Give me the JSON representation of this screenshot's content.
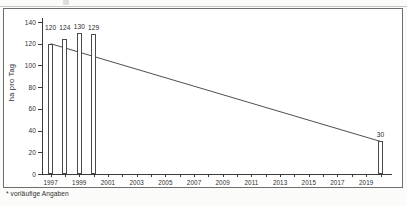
{
  "figure": {
    "footnote": "* vorläufige Angaben",
    "frame_color": "#6e6e6c",
    "ink_color": "#3a3a38",
    "bar_fill": "#ffffff",
    "bar_stroke": "#4a4a48"
  },
  "chart_data": {
    "type": "bar",
    "title": "",
    "xlabel": "",
    "ylabel": "ha pro Tag",
    "ylim": [
      0,
      140
    ],
    "ytick_values": [
      0,
      20,
      40,
      60,
      80,
      100,
      120,
      140
    ],
    "ytick_labels": [
      "0",
      "20",
      "40",
      "60",
      "80",
      "100",
      "120",
      "140"
    ],
    "grid": false,
    "legend": "none",
    "xlim": [
      1996.4,
      2020.8
    ],
    "xtick_values": [
      1997,
      1998,
      1999,
      2000,
      2001,
      2002,
      2003,
      2004,
      2005,
      2006,
      2007,
      2008,
      2009,
      2010,
      2011,
      2012,
      2013,
      2014,
      2015,
      2016,
      2017,
      2018,
      2019,
      2020
    ],
    "xtick_labels": [
      {
        "x": 1997,
        "label": "1997"
      },
      {
        "x": 1999,
        "label": "1999"
      },
      {
        "x": 2001,
        "label": "2001"
      },
      {
        "x": 2003,
        "label": "2003"
      },
      {
        "x": 2005,
        "label": "2005"
      },
      {
        "x": 2007,
        "label": "2007"
      },
      {
        "x": 2009,
        "label": "2009"
      },
      {
        "x": 2011,
        "label": "2011"
      },
      {
        "x": 2013,
        "label": "2013"
      },
      {
        "x": 2015,
        "label": "2015"
      },
      {
        "x": 2017,
        "label": "2017"
      },
      {
        "x": 2019,
        "label": "2019"
      }
    ],
    "categories": [
      1997,
      1998,
      1999,
      2000,
      2020
    ],
    "values": [
      120,
      124,
      130,
      129,
      30
    ],
    "bar_labels": [
      "120",
      "124",
      "130",
      "129",
      "30"
    ],
    "series": [
      {
        "name": "ha pro Tag",
        "type": "bar",
        "points": [
          {
            "x": 1997,
            "y": 120,
            "label": "120"
          },
          {
            "x": 1998,
            "y": 124,
            "label": "124"
          },
          {
            "x": 1999,
            "y": 130,
            "label": "130"
          },
          {
            "x": 2000,
            "y": 129,
            "label": "129"
          },
          {
            "x": 2020,
            "y": 30,
            "label": "30"
          }
        ]
      },
      {
        "name": "Zielline",
        "type": "line",
        "points": [
          {
            "x": 1997,
            "y": 120
          },
          {
            "x": 2020,
            "y": 30
          }
        ]
      }
    ]
  }
}
